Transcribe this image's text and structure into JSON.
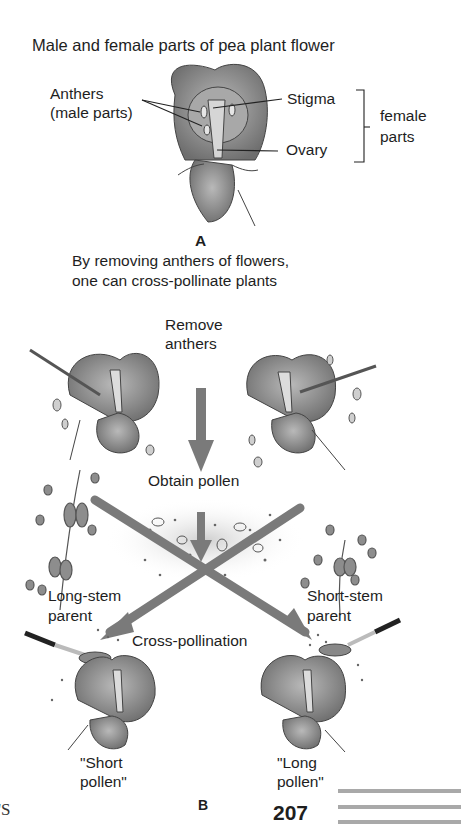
{
  "panel_a": {
    "title": "Male and female parts of pea plant flower",
    "labels": {
      "anthers_line1": "Anthers",
      "anthers_line2": "(male parts)",
      "stigma": "Stigma",
      "ovary": "Ovary",
      "female_line1": "female",
      "female_line2": "parts"
    },
    "letter": "A",
    "caption_line1": "By removing anthers of flowers,",
    "caption_line2": "one can cross-pollinate plants"
  },
  "panel_b": {
    "remove_line1": "Remove",
    "remove_line2": "anthers",
    "obtain_pollen": "Obtain pollen",
    "long_stem_line1": "Long-stem",
    "long_stem_line2": "parent",
    "short_stem_line1": "Short-stem",
    "short_stem_line2": "parent",
    "cross_pollination": "Cross-pollination",
    "short_pollen_line1": "\"Short",
    "short_pollen_line2": "pollen\"",
    "long_pollen_line1": "\"Long",
    "long_pollen_line2": "pollen\"",
    "letter": "B"
  },
  "page": {
    "number": "207",
    "folio_fragment": "'S"
  },
  "colors": {
    "text": "#1e1e1e",
    "petal": "#8a8a8a",
    "arrow": "#7a7a7a",
    "rule": "#a9a9a9"
  }
}
